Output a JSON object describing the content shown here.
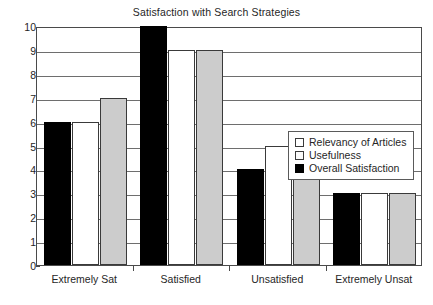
{
  "chart_data": {
    "type": "bar",
    "title": "Satisfaction with Search Strategies",
    "xlabel": "",
    "ylabel": "",
    "ylim": [
      0,
      10
    ],
    "ytick_step": 1,
    "yticks": [
      0,
      1,
      2,
      3,
      4,
      5,
      6,
      7,
      8,
      9,
      10
    ],
    "grid": true,
    "grid_axis": "y",
    "legend_position": "center-right",
    "categories": [
      "Extremely Sat",
      "Satisfied",
      "Unsatisfied",
      "Extremely Unsat"
    ],
    "series": [
      {
        "name": "Relevancy of Articles",
        "color": "#ffffff",
        "values": [
          6,
          9,
          5,
          3
        ]
      },
      {
        "name": "Usefulness",
        "color": "#cccccc",
        "values": [
          7,
          9,
          5,
          3
        ]
      },
      {
        "name": "Overall Satisfaction",
        "color": "#000000",
        "values": [
          6,
          10,
          4,
          3
        ]
      }
    ],
    "bar_draw_order": [
      "Overall Satisfaction",
      "Relevancy of Articles",
      "Usefulness"
    ]
  },
  "legend": {
    "items": [
      {
        "label": "Relevancy of Articles",
        "swatch": "open-square-white-icon"
      },
      {
        "label": "Usefulness",
        "swatch": "open-square-light-icon"
      },
      {
        "label": "Overall Satisfaction",
        "swatch": "filled-square-black-icon"
      }
    ]
  },
  "axis": {
    "y_tick_labels": [
      "10",
      "9",
      "8",
      "7",
      "6",
      "5",
      "4",
      "3",
      "2",
      "1",
      "0"
    ],
    "x_tick_labels": [
      "Extremely Sat",
      "Satisfied",
      "Unsatisfied",
      "Extremely Unsat"
    ]
  }
}
